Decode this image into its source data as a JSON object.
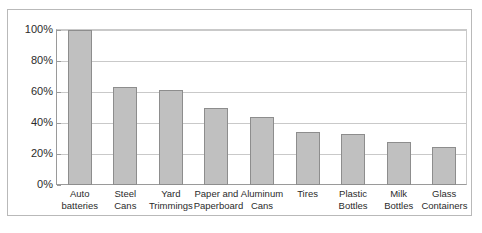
{
  "chart_data": {
    "type": "bar",
    "title": "",
    "subtitle": "",
    "xlabel": "",
    "ylabel": "",
    "categories": [
      "Auto batteries",
      "Steel Cans",
      "Yard Trimmings",
      "Paper and Paperboard",
      "Aluminum Cans",
      "Tires",
      "Plastic Bottles",
      "Milk Bottles",
      "Glass Containers"
    ],
    "values": [
      100,
      63,
      61.5,
      50,
      44,
      34.5,
      33,
      27.5,
      24.5
    ],
    "ylim": [
      0,
      100
    ],
    "ytick_values": [
      0,
      20,
      40,
      60,
      80,
      100
    ],
    "ytick_labels": [
      "0%",
      "20%",
      "40%",
      "60%",
      "80%",
      "100%"
    ],
    "grid": true,
    "legend": false,
    "legend_position": "none",
    "bar_color": "#c0c0c0",
    "bar_border_color": "#8d8d8d",
    "gridline_color": "#c9c9c9",
    "axis_color": "#9a9a9a",
    "frame_color": "#b9b9b9",
    "background_color": "#ffffff",
    "text_color": "#2b2b2b"
  }
}
